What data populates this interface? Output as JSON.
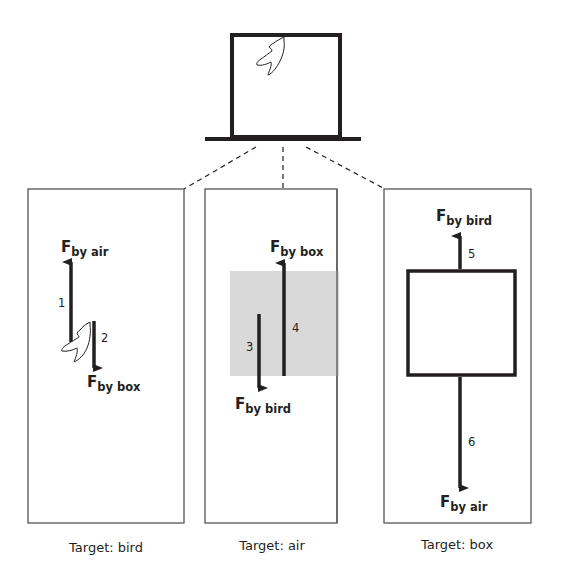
{
  "figure": {
    "scene": {
      "objects": [
        "box",
        "bird",
        "support"
      ],
      "description": "A bird perched inside a closed box resting on a surface"
    },
    "panels": [
      {
        "id": "bird",
        "caption": "Target: bird",
        "forces": [
          {
            "number": "1",
            "symbol": "F",
            "subscript": "by air",
            "direction": "up"
          },
          {
            "number": "2",
            "symbol": "F",
            "subscript": "by box",
            "direction": "down"
          }
        ]
      },
      {
        "id": "air",
        "caption": "Target: air",
        "forces": [
          {
            "number": "3",
            "symbol": "F",
            "subscript": "by bird",
            "direction": "down"
          },
          {
            "number": "4",
            "symbol": "F",
            "subscript": "by box",
            "direction": "up"
          }
        ]
      },
      {
        "id": "box",
        "caption": "Target: box",
        "forces": [
          {
            "number": "5",
            "symbol": "F",
            "subscript": "by bird",
            "direction": "up"
          },
          {
            "number": "6",
            "symbol": "F",
            "subscript": "by air",
            "direction": "down"
          }
        ]
      }
    ],
    "colors": {
      "stroke": "#231f20",
      "air_fill": "#d9d9d9",
      "panel_border": "#555555"
    }
  }
}
